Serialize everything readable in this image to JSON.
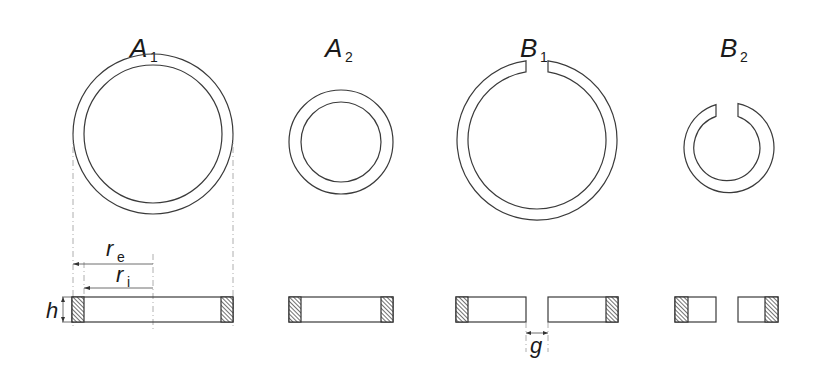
{
  "diagram": {
    "rings": [
      {
        "id": "A1",
        "letter": "A",
        "subscript": "1",
        "type": "closed"
      },
      {
        "id": "A2",
        "letter": "A",
        "subscript": "2",
        "type": "closed"
      },
      {
        "id": "B1",
        "letter": "B",
        "subscript": "1",
        "type": "split"
      },
      {
        "id": "B2",
        "letter": "B",
        "subscript": "2",
        "type": "split"
      }
    ],
    "dimensions": {
      "outer_radius": {
        "symbol": "r",
        "subscript": "e"
      },
      "inner_radius": {
        "symbol": "r",
        "subscript": "i"
      },
      "height": {
        "symbol": "h"
      },
      "gap": {
        "symbol": "g"
      }
    },
    "colors": {
      "line": "#3a3a3a",
      "hatch": "#3a3a3a",
      "construction": "#9a9a9a",
      "background": "#ffffff"
    }
  }
}
